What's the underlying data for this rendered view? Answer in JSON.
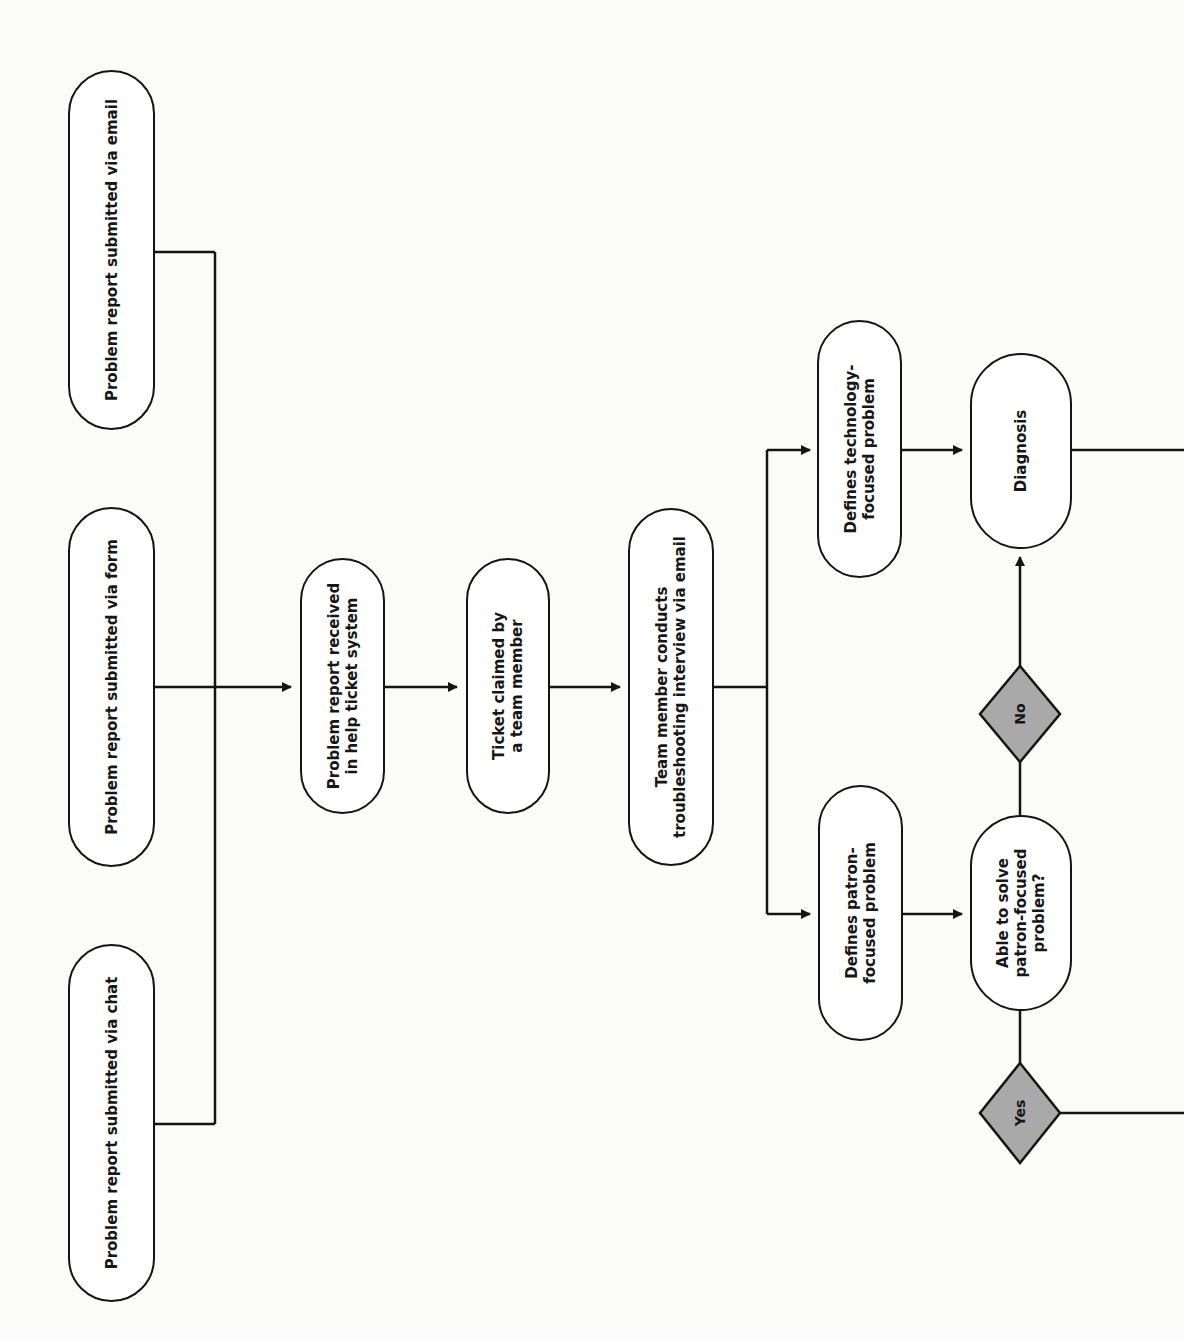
{
  "diagram": {
    "orientation": "rotated 90° counter-clockwise",
    "colors": {
      "background": "#fbfbfa",
      "stroke": "#141414",
      "node_fill": "#ffffff",
      "decision_fill": "#a9a9a9"
    },
    "nodes": {
      "email": {
        "label": "Problem report submitted via email"
      },
      "form": {
        "label": "Problem report submitted via form"
      },
      "chat": {
        "label": "Problem report submitted via chat"
      },
      "received": {
        "label": "Problem report received\nin help ticket system"
      },
      "claimed": {
        "label": "Ticket claimed by\na team member"
      },
      "interview": {
        "label": "Team member conducts\ntroubleshooting interview via email"
      },
      "tech_problem": {
        "label": "Defines technology-\nfocused problem"
      },
      "patron_problem": {
        "label": "Defines patron-\nfocused problem"
      },
      "diagnosis": {
        "label": "Diagnosis"
      },
      "able_to_solve": {
        "label": "Able to solve\npatron-focused\nproblem?"
      }
    },
    "decisions": {
      "no": {
        "label": "No"
      },
      "yes": {
        "label": "Yes"
      }
    },
    "edges": [
      {
        "from": "email",
        "to": "received"
      },
      {
        "from": "form",
        "to": "received"
      },
      {
        "from": "chat",
        "to": "received"
      },
      {
        "from": "received",
        "to": "claimed"
      },
      {
        "from": "claimed",
        "to": "interview"
      },
      {
        "from": "interview",
        "to": "tech_problem"
      },
      {
        "from": "interview",
        "to": "patron_problem"
      },
      {
        "from": "tech_problem",
        "to": "diagnosis"
      },
      {
        "from": "patron_problem",
        "to": "able_to_solve"
      },
      {
        "from": "able_to_solve",
        "to": "no"
      },
      {
        "from": "no",
        "to": "diagnosis"
      },
      {
        "from": "able_to_solve",
        "to": "yes"
      },
      {
        "from": "diagnosis",
        "to": "offscreen-right"
      },
      {
        "from": "yes",
        "to": "offscreen-right"
      }
    ]
  }
}
